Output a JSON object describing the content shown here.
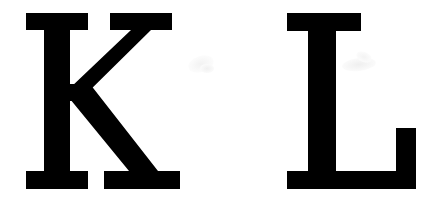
{
  "image": {
    "kind": "scanned-letterform-pair",
    "background_color": "#ffffff",
    "ink_color": "#000000",
    "width": 442,
    "height": 214,
    "text_content": "K L",
    "typeface_style": "serif",
    "letter_case": "uppercase",
    "alt_description": "Two large black serif capital letters K and L on a white background"
  },
  "glyphs": [
    {
      "id": "glyph-k",
      "character": "K",
      "name": "letter-k",
      "color": "#000000",
      "bounds": {
        "x": 25,
        "y": 13,
        "width": 155,
        "height": 176
      },
      "cap_height": 176,
      "baseline_y": 189,
      "top_y": 13
    },
    {
      "id": "glyph-l",
      "character": "L",
      "name": "letter-l",
      "color": "#000000",
      "bounds": {
        "x": 286,
        "y": 13,
        "width": 130,
        "height": 176
      },
      "cap_height": 176,
      "baseline_y": 189,
      "top_y": 13
    }
  ],
  "artifacts": [
    {
      "id": "artifact-one",
      "name": "scan-smudge-upper-left",
      "color": "#f2f2f2"
    },
    {
      "id": "artifact-two",
      "name": "scan-smudge-upper-left-small",
      "color": "#f0f0f0"
    },
    {
      "id": "artifact-three",
      "name": "scan-smudge-upper-right",
      "color": "#efefef"
    },
    {
      "id": "artifact-four",
      "name": "scan-smudge-upper-right-small",
      "color": "#f3f3f3"
    }
  ]
}
